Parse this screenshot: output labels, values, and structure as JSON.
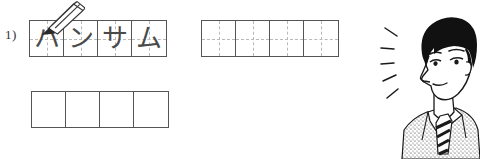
{
  "page": {
    "kind": "katakana-writing-practice-worksheet",
    "background_color": "#ffffff",
    "ink_color": "#555555",
    "guide_color": "#b9b9b9",
    "glyph_color": "#4a4a4a"
  },
  "item": {
    "number_label": "1)",
    "word_romaji": "hansamu",
    "word_meaning": "handsome"
  },
  "grids": {
    "traced": {
      "name": "traced-word-grid",
      "cells": 4,
      "has_guides": true,
      "characters": [
        "ハ",
        "ン",
        "サ",
        "ム"
      ]
    },
    "practice": {
      "name": "practice-grid",
      "cells": 4,
      "has_guides": true,
      "characters": [
        "",
        "",
        "",
        ""
      ]
    },
    "blank": {
      "name": "blank-grid",
      "cells": 4,
      "has_guides": false,
      "characters": [
        "",
        "",
        "",
        ""
      ]
    }
  },
  "pencil": {
    "icon_name": "pencil-icon",
    "points_to_cell": 1
  },
  "illustration": {
    "icon_name": "handsome-man-portrait",
    "description": "manga style portrait of a man in a suit and striped tie with emphasis lines",
    "emphasis_line_count": 5,
    "hair_color": "#111111",
    "skin_color": "#ffffff"
  }
}
